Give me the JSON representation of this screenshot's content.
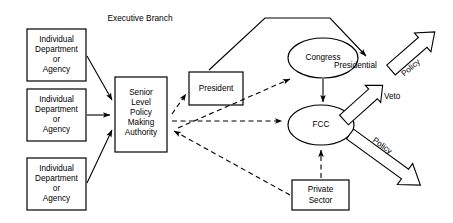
{
  "diagram": {
    "caption": "Executive Branch",
    "nodes": {
      "dept1": {
        "lines": [
          "Individual",
          "Department",
          "or",
          "Agency"
        ]
      },
      "dept2": {
        "lines": [
          "Individual",
          "Department",
          "or",
          "Agency"
        ]
      },
      "dept3": {
        "lines": [
          "Individual",
          "Department",
          "or",
          "Agency"
        ]
      },
      "senior": {
        "lines": [
          "Senior",
          "Level",
          "Policy",
          "Making",
          "Authority"
        ]
      },
      "president": {
        "label": "President"
      },
      "congress": {
        "label": "Congress"
      },
      "fcc": {
        "label": "FCC"
      },
      "private_sector": {
        "lines": [
          "Private",
          "Sector"
        ]
      }
    },
    "edge_labels": {
      "presidential": "Presidential",
      "veto": "Veto",
      "policy_upper": "Policy",
      "policy_lower": "Policy"
    },
    "colors": {
      "stroke": "#000000",
      "fill": "#ffffff",
      "background": "#ffffff"
    }
  }
}
